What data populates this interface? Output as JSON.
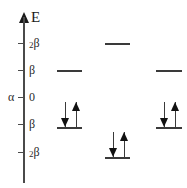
{
  "diagram": {
    "axis": {
      "name": "axis-energy",
      "label": "E",
      "arrow_direction": "up",
      "line_color": "#4a4a4a",
      "ticks": [
        {
          "id": "tick-plus-2beta",
          "coef": "2",
          "symbol": "β",
          "value": 2,
          "y": 43
        },
        {
          "id": "tick-plus-beta",
          "coef": "",
          "symbol": "β",
          "value": 1,
          "y": 70
        },
        {
          "id": "tick-zero",
          "coef": "",
          "symbol": "0",
          "value": 0,
          "y": 97
        },
        {
          "id": "tick-minus-beta",
          "coef": "",
          "symbol": "β",
          "value": -1,
          "y": 124
        },
        {
          "id": "tick-minus-2beta",
          "coef": "2",
          "symbol": "β",
          "value": -2,
          "y": 152
        }
      ],
      "origin_marker": {
        "id": "alpha-marker",
        "label": "α",
        "y": 97
      }
    },
    "columns": [
      {
        "name": "column-left",
        "x": 57,
        "width": 25,
        "levels": [
          {
            "name": "level-left-antibonding",
            "energy_label": "β",
            "y": 70,
            "electrons": 0,
            "arrows": []
          },
          {
            "name": "level-left-bonding",
            "energy_label": "-β",
            "y": 127,
            "electrons": 2,
            "arrows": [
              "down",
              "up"
            ]
          }
        ]
      },
      {
        "name": "column-middle",
        "x": 105,
        "width": 25,
        "levels": [
          {
            "name": "level-middle-antibonding",
            "energy_label": "2β",
            "y": 43,
            "electrons": 0,
            "arrows": []
          },
          {
            "name": "level-middle-bonding",
            "energy_label": "-2β",
            "y": 157,
            "electrons": 2,
            "arrows": [
              "down",
              "up"
            ]
          }
        ]
      },
      {
        "name": "column-right",
        "x": 156,
        "width": 26,
        "levels": [
          {
            "name": "level-right-antibonding",
            "energy_label": "β",
            "y": 70,
            "electrons": 0,
            "arrows": []
          },
          {
            "name": "level-right-bonding",
            "energy_label": "-β",
            "y": 127,
            "electrons": 2,
            "arrows": [
              "down",
              "up"
            ]
          }
        ]
      }
    ],
    "colors": {
      "level": "#3a3a3a",
      "arrow": "#111111",
      "axis": "#4a4a4a",
      "text": "#2a2a2a",
      "background": "#ffffff"
    }
  }
}
